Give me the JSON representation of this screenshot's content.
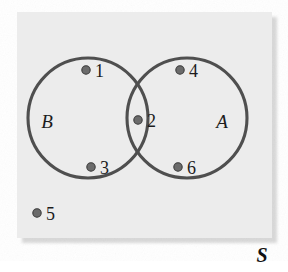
{
  "diagram": {
    "type": "venn-diagram",
    "universe": {
      "label": "S",
      "label_x": 262,
      "label_y": 262,
      "rect": {
        "x": 17,
        "y": 12,
        "width": 255,
        "height": 226
      },
      "fill_color": "#ececec",
      "shadow_color": "#d8d8d8"
    },
    "sets": [
      {
        "name": "set-b",
        "label": "B",
        "cx": 88,
        "cy": 118,
        "r": 60,
        "label_x": 47,
        "label_y": 128,
        "stroke_color": "#4f4f4f"
      },
      {
        "name": "set-a",
        "label": "A",
        "cx": 187,
        "cy": 118,
        "r": 60,
        "label_x": 222,
        "label_y": 128,
        "stroke_color": "#4f4f4f"
      }
    ],
    "elements": [
      {
        "label": "1",
        "cx": 86,
        "cy": 70,
        "region": "B only",
        "label_x": 95,
        "label_y": 77
      },
      {
        "label": "2",
        "cx": 138,
        "cy": 120,
        "region": "A and B",
        "label_x": 147,
        "label_y": 127
      },
      {
        "label": "3",
        "cx": 91,
        "cy": 167,
        "region": "B only",
        "label_x": 100,
        "label_y": 174
      },
      {
        "label": "4",
        "cx": 180,
        "cy": 70,
        "region": "A only",
        "label_x": 189,
        "label_y": 77
      },
      {
        "label": "5",
        "cx": 37,
        "cy": 213,
        "region": "S only",
        "label_x": 46,
        "label_y": 220
      },
      {
        "label": "6",
        "cx": 178,
        "cy": 167,
        "region": "A only",
        "label_x": 187,
        "label_y": 174
      }
    ],
    "dot_color": "#6b6b6b",
    "dot_outline_color": "#3a3a3a",
    "dot_radius": 4.2
  }
}
